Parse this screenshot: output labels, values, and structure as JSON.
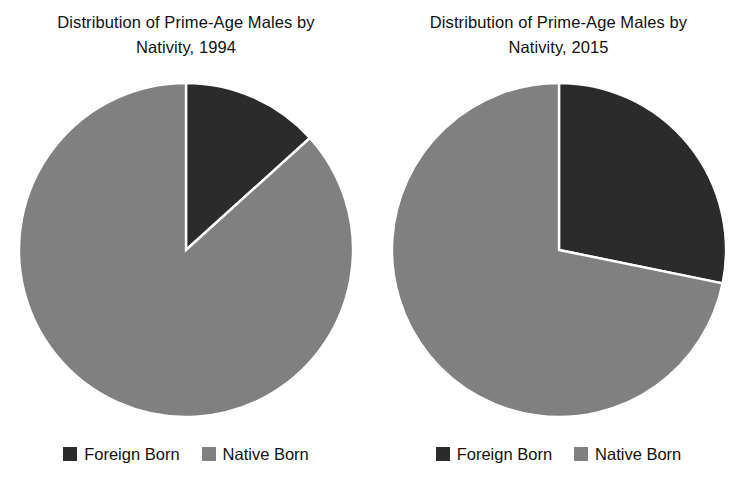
{
  "figure": {
    "background_color": "#ffffff",
    "text_color": "#111111"
  },
  "colors": {
    "foreign_born": "#2b2b2b",
    "native_born": "#808080",
    "slice_border": "#ffffff"
  },
  "legend": {
    "foreign_born_label": "Foreign Born",
    "native_born_label": "Native Born",
    "foreign_born_swatch": "foreign-born-swatch",
    "native_born_swatch": "native-born-swatch"
  },
  "panels": [
    {
      "id": "panel-1994",
      "title": "Distribution of Prime-Age Males by\nNativity, 1994",
      "year": "1994"
    },
    {
      "id": "panel-2015",
      "title": "Distribution of Prime-Age Males by\nNativity, 2015",
      "year": "2015"
    }
  ],
  "chart_data": [
    {
      "type": "pie",
      "title": "Distribution of Prime-Age Males by Nativity, 1994",
      "categories": [
        "Foreign Born",
        "Native Born"
      ],
      "values": [
        13.3,
        86.7
      ],
      "colors": [
        "#2b2b2b",
        "#808080"
      ],
      "start_angle_deg": 90,
      "direction": "clockwise",
      "legend_position": "bottom",
      "grid": false,
      "xlabel": "",
      "ylabel": ""
    },
    {
      "type": "pie",
      "title": "Distribution of Prime-Age Males by Nativity, 2015",
      "categories": [
        "Foreign Born",
        "Native Born"
      ],
      "values": [
        28.2,
        71.8
      ],
      "colors": [
        "#2b2b2b",
        "#808080"
      ],
      "start_angle_deg": 90,
      "direction": "clockwise",
      "legend_position": "bottom",
      "grid": false,
      "xlabel": "",
      "ylabel": ""
    }
  ]
}
